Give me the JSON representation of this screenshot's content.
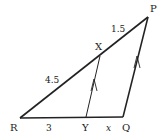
{
  "diagram": {
    "type": "triangle-with-parallel-line",
    "vertices": {
      "P": {
        "label": "P",
        "x": 148,
        "y": 17
      },
      "Q": {
        "label": "Q",
        "x": 123,
        "y": 117
      },
      "R": {
        "label": "R",
        "x": 20,
        "y": 118
      },
      "X": {
        "label": "X",
        "x": 100,
        "y": 56
      },
      "Y": {
        "label": "Y",
        "x": 86,
        "y": 117
      }
    },
    "segments": {
      "RX": {
        "label": "4.5"
      },
      "XP": {
        "label": "1.5"
      },
      "RY": {
        "label": "3"
      },
      "YQ": {
        "label": "x"
      }
    },
    "parallel_marks": [
      "XY",
      "PQ"
    ],
    "stroke_color": "#222222",
    "background": "#ffffff"
  }
}
